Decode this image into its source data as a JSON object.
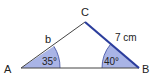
{
  "diagram": {
    "type": "triangle",
    "vertices": {
      "A": {
        "label": "A"
      },
      "B": {
        "label": "B"
      },
      "C": {
        "label": "C"
      }
    },
    "sides": {
      "AC": {
        "label": "b"
      },
      "BC": {
        "label": "7 cm",
        "highlighted": true
      }
    },
    "angles": {
      "A": {
        "label": "35°"
      },
      "B": {
        "label": "40°"
      }
    },
    "colors": {
      "line": "#333333",
      "highlight_side": "#2b3d9c",
      "angle_fill": "#a9b4e6",
      "angle_stroke": "#3a4a9e"
    }
  }
}
